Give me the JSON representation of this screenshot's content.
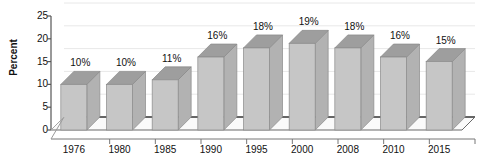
{
  "chart_data": {
    "type": "bar",
    "title": "",
    "subtitle": "",
    "xlabel": "",
    "ylabel": "Percent",
    "categories": [
      "1976",
      "1980",
      "1985",
      "1990",
      "1995",
      "2000",
      "2008",
      "2010",
      "2015"
    ],
    "values": [
      10,
      10,
      11,
      16,
      18,
      19,
      18,
      16,
      15
    ],
    "data_labels": [
      "10%",
      "10%",
      "11%",
      "16%",
      "18%",
      "19%",
      "18%",
      "16%",
      "15%"
    ],
    "ylim": [
      0,
      25
    ],
    "yticks": [
      0,
      5,
      10,
      15,
      20,
      25
    ],
    "ytick_labels": [
      "0",
      "5",
      "10",
      "15",
      "20",
      "25"
    ],
    "grid": true,
    "legend": "none",
    "style": "3d-column",
    "colors": {
      "bar_front": "#c6c6c6",
      "bar_top": "#9e9e9e",
      "bar_side": "#b2b2b2",
      "bar_edge": "#8a8a8a",
      "axis": "#555555",
      "grid": "#e8e8e8",
      "floor": "#fafafa",
      "back_wall_line": "#333333",
      "text": "#111111",
      "background": "#ffffff"
    }
  }
}
